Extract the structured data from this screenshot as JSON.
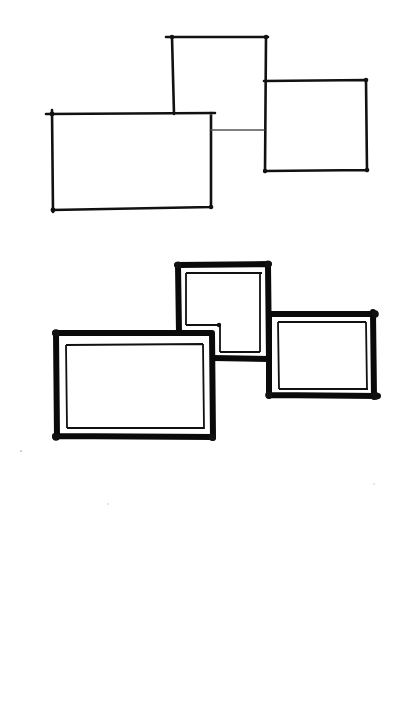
{
  "diagram": {
    "colors": {
      "ink": "#111111",
      "background": "#ffffff"
    },
    "top_sketch": {
      "style": "thin single line",
      "rects": [
        {
          "name": "upper-middle",
          "x1": 172,
          "y1": 37,
          "x2": 266,
          "y2": 114
        },
        {
          "name": "left-large",
          "x1": 52,
          "y1": 114,
          "x2": 211,
          "y2": 208
        },
        {
          "name": "right",
          "x1": 264,
          "y1": 80,
          "x2": 366,
          "y2": 171
        }
      ],
      "connector": {
        "x1": 211,
        "y1": 130,
        "x2": 264,
        "y2": 130
      }
    },
    "bottom_sketch": {
      "style": "thick outer line with thin inner line",
      "rects": [
        {
          "name": "upper-middle",
          "x1": 178,
          "y1": 265,
          "x2": 268,
          "y2": 360
        },
        {
          "name": "left-large",
          "x1": 56,
          "y1": 333,
          "x2": 212,
          "y2": 437
        },
        {
          "name": "right",
          "x1": 268,
          "y1": 314,
          "x2": 377,
          "y2": 397
        }
      ]
    }
  }
}
